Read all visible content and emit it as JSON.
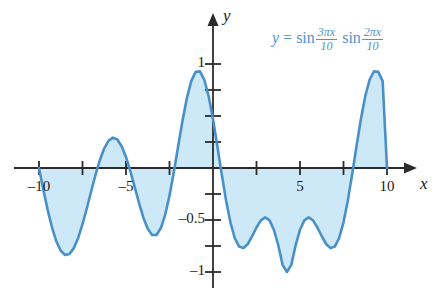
{
  "chart_data": {
    "type": "line",
    "title": "",
    "equation_text": "y = sin 3πx/10  sin 2πx/10",
    "equation_parts": {
      "lhs": "y",
      "equals": "=",
      "sin1": "sin",
      "num1": "3πx",
      "den1": "10",
      "sin2": "sin",
      "num2": "2πx",
      "den2": "10"
    },
    "xlabel": "x",
    "ylabel": "y",
    "xlim": [
      -11.6,
      11.6
    ],
    "ylim": [
      -1.22,
      1.22
    ],
    "x_tick_values": [
      -10,
      -7.5,
      -5,
      -2.5,
      2.5,
      5,
      7.5,
      10
    ],
    "x_tick_labels": [
      {
        "value": -10,
        "label": "–10"
      },
      {
        "value": -5,
        "label": "–5"
      },
      {
        "value": 5,
        "label": "5"
      },
      {
        "value": 10,
        "label": "10"
      }
    ],
    "y_tick_values": [
      1,
      0.75,
      0.5,
      0.25,
      -0.25,
      -0.5,
      -0.75,
      -1
    ],
    "y_tick_labels": [
      {
        "value": 1,
        "label": "1"
      },
      {
        "value": -0.5,
        "label": "–0.5"
      },
      {
        "value": -1,
        "label": "–1"
      }
    ],
    "grid": false,
    "legend": "none",
    "fill": "between curve and x-axis",
    "domain_start": -10,
    "domain_end": 10,
    "curve_color": "#4a90c8",
    "fill_color": "#cde8f6",
    "axis_color": "#2b2b2b",
    "equation_color": "#4e93cf",
    "x": [
      -10,
      -9.75,
      -9.5,
      -9.25,
      -9,
      -8.75,
      -8.5,
      -8.25,
      -8,
      -7.75,
      -7.5,
      -7.25,
      -7,
      -6.75,
      -6.5,
      -6.25,
      -6,
      -5.75,
      -5.5,
      -5.25,
      -5,
      -4.75,
      -4.5,
      -4.25,
      -4,
      -3.75,
      -3.5,
      -3.25,
      -3,
      -2.75,
      -2.5,
      -2.25,
      -2,
      -1.75,
      -1.5,
      -1.25,
      -1,
      -0.75,
      -0.5,
      -0.25,
      0,
      0.25,
      0.5,
      0.75,
      1,
      1.25,
      1.5,
      1.75,
      2,
      2.25,
      2.5,
      2.75,
      3,
      3.25,
      3.5,
      3.75,
      4,
      4.25,
      4.5,
      4.75,
      5,
      5.25,
      5.5,
      5.75,
      6,
      6.25,
      6.5,
      6.75,
      7,
      7.25,
      7.5,
      7.75,
      8,
      8.25,
      8.5,
      8.75,
      9,
      9.25,
      9.5,
      9.75,
      10
    ],
    "y": [
      0.0,
      -0.2091,
      -0.4045,
      -0.574,
      -0.7071,
      -0.7961,
      -0.8365,
      -0.8272,
      -0.7705,
      -0.6722,
      -0.5406,
      -0.3868,
      -0.2236,
      -0.0646,
      0.0769,
      0.1892,
      0.2629,
      0.2919,
      0.2736,
      0.2097,
      0.1056,
      -0.0296,
      -0.1827,
      -0.3378,
      -0.4775,
      -0.5847,
      -0.6441,
      -0.6446,
      -0.5801,
      -0.4514,
      -0.2659,
      -0.0378,
      0.2118,
      0.4578,
      0.6737,
      0.8352,
      0.9239,
      0.929,
      0.8486,
      0.6903,
      0.4705,
      0.2118,
      -0.0585,
      -0.3116,
      -0.5225,
      -0.6732,
      -0.7553,
      -0.7705,
      -0.7307,
      -0.656,
      -0.5717,
      -0.5037,
      -0.4755,
      -0.5034,
      -0.594,
      -0.7423,
      -0.9315,
      -1.0,
      -0.9315,
      -0.7423,
      -0.594,
      -0.5034,
      -0.4755,
      -0.5037,
      -0.5717,
      -0.656,
      -0.7307,
      -0.7705,
      -0.7553,
      -0.6732,
      -0.5225,
      -0.3116,
      -0.0585,
      0.2118,
      0.4705,
      0.6903,
      0.8486,
      0.929,
      0.9239,
      0.8352,
      0.0
    ]
  }
}
